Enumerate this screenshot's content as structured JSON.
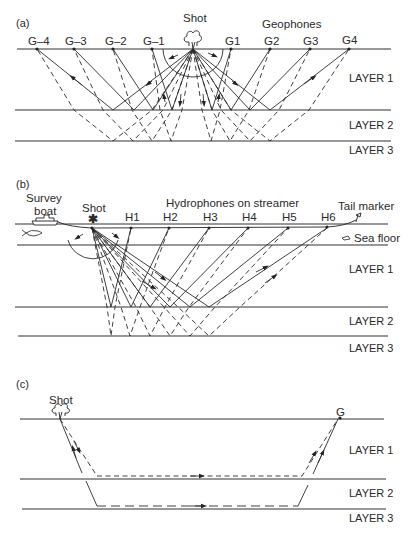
{
  "figure": {
    "panels": [
      {
        "id": "a",
        "label": "(a)",
        "source_label": "Shot",
        "receiver_group_label": "Geophones",
        "receivers": [
          "G–4",
          "G–3",
          "G–2",
          "G–1",
          "G1",
          "G2",
          "G3",
          "G4"
        ],
        "layers": [
          "LAYER 1",
          "LAYER 2",
          "LAYER 3"
        ]
      },
      {
        "id": "b",
        "label": "(b)",
        "boat_label_line1": "Survey",
        "boat_label_line2": "boat",
        "source_label": "Shot",
        "receiver_group_label": "Hydrophones on streamer",
        "tail_label": "Tail marker",
        "seafloor_label": "Sea floor",
        "receivers": [
          "H1",
          "H2",
          "H3",
          "H4",
          "H5",
          "H6"
        ],
        "layers": [
          "LAYER 1",
          "LAYER 2",
          "LAYER 3"
        ]
      },
      {
        "id": "c",
        "label": "(c)",
        "source_label": "Shot",
        "receiver_label": "G",
        "layers": [
          "LAYER 1",
          "LAYER 2",
          "LAYER 3"
        ]
      }
    ]
  },
  "colors": {
    "ink": "#2b2b2b",
    "background": "#ffffff"
  },
  "icons": {
    "explosion": "explosion-cloud-icon",
    "star_shot": "asterisk-shot-icon",
    "boat": "boat-icon",
    "fish": "fish-icon",
    "tail_buoy": "tail-buoy-icon"
  }
}
